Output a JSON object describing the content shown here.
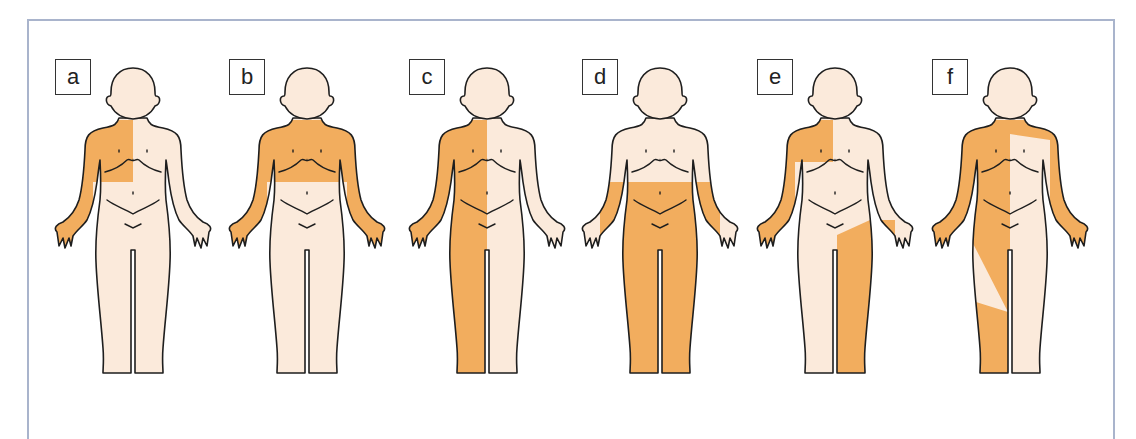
{
  "figure": {
    "title": "",
    "colors": {
      "skin": "#fbeadb",
      "shaded": "#f2ad5e",
      "outline": "#1e1e1e",
      "frame_border": "#a9b4cc",
      "background": "#ffffff"
    },
    "panels": [
      {
        "label": "a",
        "description": "Right upper chest and right arm shaded (upper-right quadrant of body)"
      },
      {
        "label": "b",
        "description": "Entire upper chest and both arms shaded"
      },
      {
        "label": "c",
        "description": "Entire right half of body shaded (hemibody), including right arm and leg"
      },
      {
        "label": "d",
        "description": "Lower body shaded from waist down, including both legs"
      },
      {
        "label": "e",
        "description": "Right upper chest and right arm shaded, plus left leg"
      },
      {
        "label": "f",
        "description": "Most of body shaded except a left chest patch, left abdomen/leg, and lower right leg"
      }
    ]
  }
}
